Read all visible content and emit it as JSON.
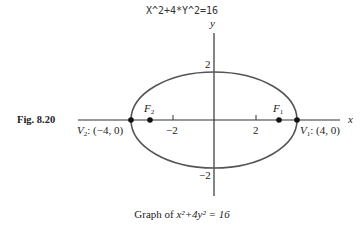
{
  "header": {
    "title": "X^2+4*Y^2=16"
  },
  "figure": {
    "label": "Fig. 8.20",
    "caption_prefix": "Graph of ",
    "caption_equation": "x²+4y² = 16",
    "axes": {
      "x_label": "x",
      "y_label": "y"
    },
    "ticks": {
      "x_neg": "−2",
      "x_pos": "2",
      "y_pos": "2",
      "y_neg": "−2"
    },
    "points": {
      "V1": {
        "label": "V",
        "sub": "1",
        "coords": ": (4, 0)"
      },
      "V2": {
        "label": "V",
        "sub": "2",
        "coords": ": (−4, 0)"
      },
      "F1": {
        "label": "F",
        "sub": "1"
      },
      "F2": {
        "label": "F",
        "sub": "2"
      }
    },
    "colors": {
      "ellipse": "#555555",
      "axes": "#333333",
      "points": "#111111"
    }
  }
}
